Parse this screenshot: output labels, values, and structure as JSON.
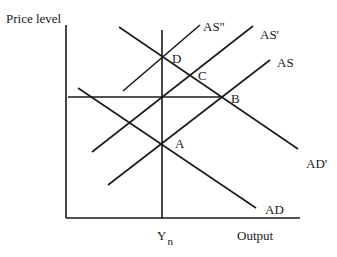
{
  "axes": {
    "y_label": "Price level",
    "x_label": "Output",
    "x_marker": "Y",
    "x_marker_sub": "n"
  },
  "curves": {
    "as": "AS",
    "as_prime": "AS'",
    "as_double_prime": "AS\"",
    "ad": "AD",
    "ad_prime": "AD'"
  },
  "points": {
    "a": "A",
    "b": "B",
    "c": "C",
    "d": "D"
  },
  "colors": {
    "line": "#1a1a1a",
    "background": "#ffffff"
  }
}
